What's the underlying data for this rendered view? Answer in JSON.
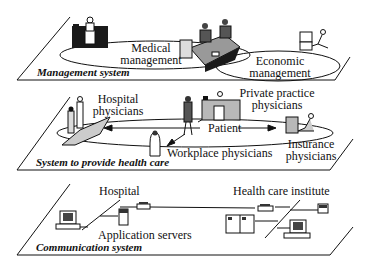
{
  "planes": {
    "management": {
      "title": "Management system",
      "labels": {
        "medical": [
          "Medical",
          "management"
        ],
        "economic": [
          "Economic",
          "management"
        ]
      }
    },
    "health_care": {
      "title": "System to provide health care",
      "labels": {
        "hospital_physicians": [
          "Hospital",
          "physicians"
        ],
        "private_practice": [
          "Private practice",
          "physicians"
        ],
        "patient": "Patient",
        "workplace": "Workplace physicians",
        "insurance": [
          "Insurance",
          "physicians"
        ]
      }
    },
    "communication": {
      "title": "Communication system",
      "labels": {
        "hospital": "Hospital",
        "application_servers": "Application servers",
        "health_care_institute": "Health care institute"
      }
    }
  },
  "colors": {
    "line": "#111111",
    "fill_gray": "#b8b8b8",
    "fill_dark": "#1a1a1a"
  }
}
